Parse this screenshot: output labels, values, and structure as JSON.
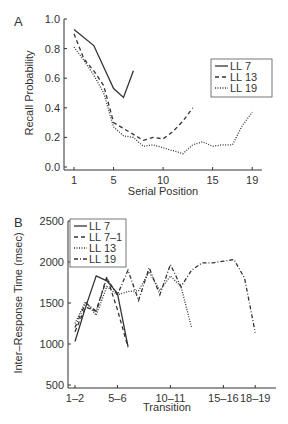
{
  "figure": {
    "panel_a_label": "A",
    "panel_b_label": "B"
  },
  "chart_data": [
    {
      "type": "line",
      "panel": "A",
      "title": "",
      "xlabel": "Serial Position",
      "ylabel": "Recall Probability",
      "xlim": [
        0,
        21
      ],
      "ylim": [
        0.0,
        1.0
      ],
      "xticks": [
        1,
        5,
        10,
        15,
        19
      ],
      "xtick_labels": [
        "1",
        "5",
        "10",
        "15",
        "19"
      ],
      "yticks": [
        0.0,
        0.2,
        0.4,
        0.6,
        0.8,
        1.0
      ],
      "ytick_labels": [
        "0.0",
        "0.2",
        "0.4",
        "0.6",
        "0.8",
        "1.0"
      ],
      "grid": false,
      "legend_position": "right",
      "series": [
        {
          "name": "LL 7",
          "style": "solid",
          "x": [
            1,
            3,
            5,
            6,
            7
          ],
          "values": [
            0.93,
            0.82,
            0.53,
            0.47,
            0.65
          ]
        },
        {
          "name": "LL 13",
          "style": "dashed",
          "x": [
            1,
            2,
            3,
            4,
            5,
            6,
            7,
            8,
            9,
            10,
            11,
            12,
            13
          ],
          "values": [
            0.9,
            0.73,
            0.65,
            0.55,
            0.3,
            0.26,
            0.22,
            0.18,
            0.2,
            0.19,
            0.24,
            0.31,
            0.4
          ]
        },
        {
          "name": "LL 19",
          "style": "dotted",
          "x": [
            1,
            2,
            3,
            4,
            5,
            6,
            7,
            8,
            9,
            10,
            11,
            12,
            13,
            14,
            15,
            16,
            17,
            18,
            19
          ],
          "values": [
            0.81,
            0.72,
            0.62,
            0.5,
            0.27,
            0.21,
            0.2,
            0.14,
            0.15,
            0.13,
            0.11,
            0.09,
            0.15,
            0.17,
            0.14,
            0.15,
            0.15,
            0.28,
            0.37
          ]
        }
      ]
    },
    {
      "type": "line",
      "panel": "B",
      "title": "",
      "xlabel": "Transition",
      "ylabel": "Inter–Response Time (msec)",
      "xlim": [
        0,
        20
      ],
      "ylim": [
        500,
        2500
      ],
      "xticks": [
        1,
        5,
        10,
        15,
        18
      ],
      "xtick_labels": [
        "1–2",
        "5–6",
        "10–11",
        "15–16",
        "18–19"
      ],
      "yticks": [
        500,
        1000,
        1500,
        2000,
        2500
      ],
      "ytick_labels": [
        "500",
        "1000",
        "1500",
        "2000",
        "2500"
      ],
      "grid": false,
      "legend_position": "upper left",
      "series": [
        {
          "name": "LL 7",
          "style": "solid",
          "x": [
            1,
            2,
            3,
            4,
            5,
            6
          ],
          "values": [
            1030,
            1450,
            1830,
            1770,
            1620,
            970
          ]
        },
        {
          "name": "LL 7–1",
          "style": "dashed",
          "x": [
            1,
            2,
            3,
            4,
            5,
            6
          ],
          "values": [
            1150,
            1450,
            1400,
            1820,
            1420,
            960
          ]
        },
        {
          "name": "LL 13",
          "style": "dotted",
          "x": [
            1,
            2,
            3,
            4,
            5,
            6,
            7,
            8,
            9,
            10,
            11,
            12
          ],
          "values": [
            1250,
            1520,
            1350,
            1700,
            1600,
            1640,
            1650,
            1880,
            1650,
            1830,
            1700,
            1200
          ]
        },
        {
          "name": "LL 19",
          "style": "dashdot",
          "x": [
            1,
            2,
            3,
            4,
            5,
            6,
            7,
            8,
            9,
            10,
            11,
            12,
            13,
            14,
            15,
            16,
            17,
            18
          ],
          "values": [
            1200,
            1500,
            1400,
            1800,
            1600,
            1900,
            1530,
            1930,
            1600,
            1970,
            1700,
            1900,
            1990,
            1990,
            2010,
            2030,
            1800,
            1140
          ]
        }
      ]
    }
  ]
}
